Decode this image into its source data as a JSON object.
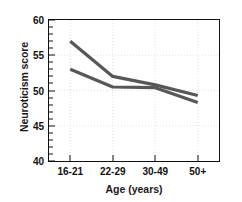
{
  "chart_data": {
    "type": "line",
    "title": "",
    "xlabel": "Age (years)",
    "ylabel": "Neuroticism score",
    "categories": [
      "16-21",
      "22-29",
      "30-49",
      "50+"
    ],
    "series": [
      {
        "name": "series-1",
        "values": [
          57.0,
          52.0,
          50.8,
          49.3
        ],
        "color": "#575757",
        "width": 3.2
      },
      {
        "name": "series-2",
        "values": [
          53.0,
          50.5,
          50.4,
          48.3
        ],
        "color": "#575757",
        "width": 3.2
      }
    ],
    "ylim": [
      40,
      60
    ],
    "ytick_values": [
      40,
      45,
      50,
      55,
      60
    ],
    "ytick_labels": [
      "40",
      "45",
      "50",
      "55",
      "60"
    ],
    "yminor_step": 1,
    "grid": true,
    "grid_color": "#d8d8d8",
    "legend": "none",
    "axis_color": "#111111",
    "background": "#ffffff"
  }
}
